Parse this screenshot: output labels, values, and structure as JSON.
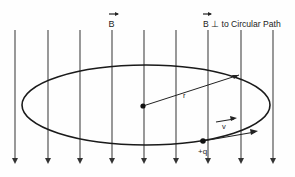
{
  "diagram": {
    "labels": {
      "b_field": "B",
      "b_perp": "B ⊥ to Circular Path",
      "radius": "r",
      "velocity": "v",
      "charge": "+q"
    },
    "field_lines_x": [
      15,
      48,
      80,
      112,
      144,
      176,
      208,
      241,
      273
    ],
    "field_direction": "down",
    "orbit": {
      "cx": 146,
      "cy": 105,
      "rx": 124,
      "ry": 40
    },
    "colors": {
      "ink": "#1a1a1a",
      "line": "#444444",
      "background": "#fefefe"
    }
  }
}
